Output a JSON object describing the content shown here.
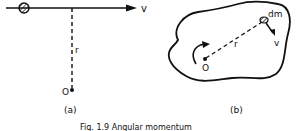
{
  "figure": {
    "caption": "Fig. 1.9  Angular momentum",
    "panel_a": {
      "label": "(a)",
      "velocity_label": "v",
      "radius_label": "r",
      "origin_label": "O"
    },
    "panel_b": {
      "label": "(b)",
      "mass_element_label": "dm",
      "velocity_label": "v",
      "radius_label": "r",
      "origin_label": "O"
    },
    "colors": {
      "ink": "#111111",
      "background": "#ffffff"
    }
  }
}
